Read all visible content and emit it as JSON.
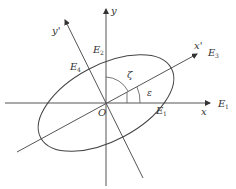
{
  "diagram": {
    "axes": {
      "x_label": "x",
      "y_label": "y",
      "x_prime_label": "x'",
      "y_prime_label": "y'",
      "origin_label": "O"
    },
    "angles": {
      "zeta": "ζ",
      "epsilon": "ε"
    },
    "points": {
      "e1_axis": {
        "base": "E",
        "sub": "1"
      },
      "e1_end": {
        "base": "E",
        "sub": "1"
      },
      "e2": {
        "base": "E",
        "sub": "2"
      },
      "e3": {
        "base": "E",
        "sub": "3"
      },
      "e4": {
        "base": "E",
        "sub": "4"
      }
    },
    "colors": {
      "line": "#444444",
      "text": "#333333"
    }
  }
}
